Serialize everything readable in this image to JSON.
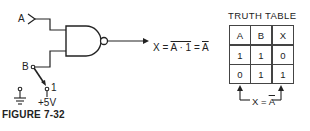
{
  "figure": {
    "caption": "FIGURE 7-32",
    "inputs": {
      "a_label": "A",
      "b_label": "B",
      "switch_pos_label": "1",
      "supply_label": "+5V"
    },
    "gate": {
      "type": "NAND",
      "inputs": 2
    },
    "output": {
      "label": "X",
      "equals": "=",
      "expr_overline": "A · 1",
      "equals2": "=",
      "result_overline": "A"
    }
  },
  "truth_table": {
    "title": "TRUTH TABLE",
    "headers": [
      "A",
      "B",
      "X"
    ],
    "rows": [
      [
        "1",
        "1",
        "0"
      ],
      [
        "0",
        "1",
        "1"
      ]
    ],
    "note_prefix": "X = ",
    "note_overline": "A"
  }
}
